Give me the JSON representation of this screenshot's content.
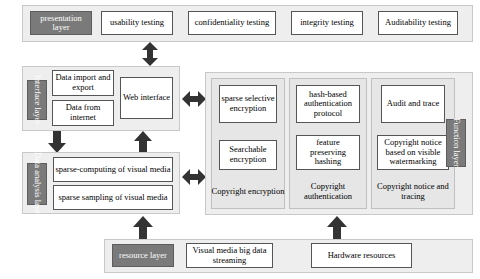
{
  "diagram": {
    "colors": {
      "panel_fill": "#eeeeee",
      "subpanel_fill": "#e6e6e6",
      "box_fill": "#ffffff",
      "layer_tag_fill": "#7a7a7a",
      "layer_tag_text": "#ffffff",
      "arrow_fill": "#333333",
      "border": "#555555"
    },
    "layers": [
      {
        "id": "presentation",
        "tag": "presentation layer",
        "orientation": "horizontal",
        "items": [
          {
            "label": "usability testing"
          },
          {
            "label": "confidentiality testing"
          },
          {
            "label": "integrity testing"
          },
          {
            "label": "Auditability testing"
          }
        ]
      },
      {
        "id": "interface",
        "tag": "Interface layer",
        "orientation": "vertical",
        "items": [
          {
            "label": "Data import and export"
          },
          {
            "label": "Data from internet"
          },
          {
            "label": "Web interface"
          }
        ]
      },
      {
        "id": "data-analysis",
        "tag": "Data analysis layer",
        "orientation": "vertical",
        "items": [
          {
            "label": "sparse-computing of visual media"
          },
          {
            "label": "sparse sampling of visual media"
          }
        ]
      },
      {
        "id": "function",
        "tag": "Function layer",
        "orientation": "vertical",
        "groups": [
          {
            "caption": "Copyright encryption",
            "items": [
              {
                "label": "sparse selective encryption"
              },
              {
                "label": "Searchable encryption"
              }
            ]
          },
          {
            "caption": "Copyright authentication",
            "items": [
              {
                "label": "hash-based authentication protocol"
              },
              {
                "label": "feature preserving hashing"
              }
            ]
          },
          {
            "caption": "Copyright notice and tracing",
            "items": [
              {
                "label": "Audit and trace"
              },
              {
                "label": "Copyright notice based on visible watermarking"
              }
            ]
          }
        ]
      },
      {
        "id": "resource",
        "tag": "resource layer",
        "orientation": "horizontal",
        "items": [
          {
            "label": "Visual media big data streaming"
          },
          {
            "label": "Hardware resources"
          }
        ]
      }
    ],
    "connectors": [
      {
        "id": "presentation-interface",
        "direction": "bidirectional-vertical"
      },
      {
        "id": "interface-analysis-down",
        "direction": "down"
      },
      {
        "id": "analysis-interface-up",
        "direction": "up"
      },
      {
        "id": "interface-function",
        "direction": "bidirectional-horizontal"
      },
      {
        "id": "analysis-function",
        "direction": "bidirectional-horizontal"
      },
      {
        "id": "resource-analysis-up",
        "direction": "up"
      },
      {
        "id": "resource-function-up",
        "direction": "up"
      }
    ]
  }
}
